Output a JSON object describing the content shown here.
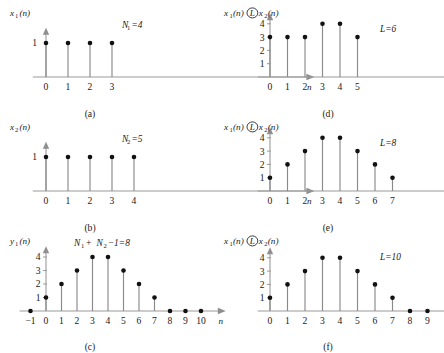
{
  "figure": {
    "caption_prefix": "",
    "axis_label_x": "n"
  },
  "chart_data": [
    {
      "id": "a",
      "type": "stem",
      "title": "",
      "ylabel": "x₁(n)",
      "ylabel_base": "x",
      "ylabel_sub": "1",
      "ylabel_tail": "(n)",
      "xlabel": "n",
      "subcaption": "(a)",
      "annotation": "N₁=4",
      "annotation_base": "N",
      "annotation_sub": "1",
      "annotation_tail": "=4",
      "x": [
        0,
        1,
        2,
        3
      ],
      "values": [
        1,
        1,
        1,
        1
      ],
      "xticks": [
        0,
        1,
        2,
        3
      ],
      "yticks": [
        1
      ],
      "ytick_labels": [
        "1"
      ],
      "ylim": [
        0,
        1.45
      ],
      "xlim": [
        -0.6,
        12.2
      ],
      "grid": false,
      "legend": "none"
    },
    {
      "id": "b",
      "type": "stem",
      "title": "",
      "ylabel": "x₂(n)",
      "ylabel_base": "x",
      "ylabel_sub": "2",
      "ylabel_tail": "(n)",
      "xlabel": "n",
      "subcaption": "(b)",
      "annotation": "N₂=5",
      "annotation_base": "N",
      "annotation_sub": "2",
      "annotation_tail": "=5",
      "x": [
        0,
        1,
        2,
        3,
        4
      ],
      "values": [
        1,
        1,
        1,
        1,
        1
      ],
      "xticks": [
        0,
        1,
        2,
        3,
        4
      ],
      "yticks": [
        1
      ],
      "ytick_labels": [
        "1"
      ],
      "ylim": [
        0,
        1.45
      ],
      "xlim": [
        -0.6,
        12.2
      ],
      "grid": false,
      "legend": "none"
    },
    {
      "id": "c",
      "type": "stem",
      "title": "",
      "ylabel": "y₁(n)",
      "ylabel_base": "y",
      "ylabel_sub": "1",
      "ylabel_tail": "(n)",
      "xlabel": "n",
      "subcaption": "(c)",
      "annotation": "N₁ + N₂ −1=8",
      "annotation_parts": [
        "N",
        "1",
        " + ",
        "N",
        "2",
        " −1=8"
      ],
      "x": [
        -1,
        0,
        1,
        2,
        3,
        4,
        5,
        6,
        7,
        8,
        9,
        10
      ],
      "values": [
        0,
        1,
        2,
        3,
        4,
        4,
        3,
        2,
        1,
        0,
        0,
        0
      ],
      "xticks": [
        -1,
        0,
        1,
        2,
        3,
        4,
        5,
        6,
        7,
        8,
        9,
        10
      ],
      "xtick_labels": [
        "−1",
        "0",
        "1",
        "2",
        "3",
        "4",
        "5",
        "6",
        "7",
        "8",
        "9",
        "10"
      ],
      "yticks": [
        1,
        2,
        3,
        4
      ],
      "ytick_labels": [
        "1",
        "2",
        "3",
        "4"
      ],
      "ylim": [
        0,
        4.8
      ],
      "xlim": [
        -1.7,
        11.6
      ],
      "grid": false,
      "legend": "none"
    },
    {
      "id": "d",
      "type": "stem",
      "title": "",
      "ylabel": "x₁(n) Ⓛ x₂(n)",
      "ylabel_parts": [
        "x",
        "1",
        "(n)",
        "L",
        "x",
        "2",
        "(n)"
      ],
      "xlabel": "n",
      "subcaption": "(d)",
      "annotation": "L=6",
      "annotation_base": "L",
      "annotation_tail": "=6",
      "x": [
        0,
        1,
        2,
        3,
        4,
        5
      ],
      "values": [
        3,
        3,
        3,
        4,
        4,
        3
      ],
      "xticks": [
        0,
        1,
        2,
        3,
        4,
        5
      ],
      "yticks": [
        1,
        2,
        3,
        4
      ],
      "ytick_labels": [
        "1",
        "2",
        "3",
        "4"
      ],
      "ylim": [
        0,
        4.8
      ],
      "xlim": [
        -0.7,
        11.6
      ],
      "grid": false,
      "legend": "none"
    },
    {
      "id": "e",
      "type": "stem",
      "title": "",
      "ylabel": "x₁(n) Ⓛ x₂(n)",
      "ylabel_parts": [
        "x",
        "1",
        "(n)",
        "L",
        "x",
        "2",
        "(n)"
      ],
      "xlabel": "n",
      "subcaption": "(e)",
      "annotation": "L=8",
      "annotation_base": "L",
      "annotation_tail": "=8",
      "x": [
        0,
        1,
        2,
        3,
        4,
        5,
        6,
        7
      ],
      "values": [
        1,
        2,
        3,
        4,
        4,
        3,
        2,
        1
      ],
      "xticks": [
        0,
        1,
        2,
        3,
        4,
        5,
        6,
        7
      ],
      "yticks": [
        1,
        2,
        3,
        4
      ],
      "ytick_labels": [
        "1",
        "2",
        "3",
        "4"
      ],
      "ylim": [
        0,
        4.8
      ],
      "xlim": [
        -0.7,
        11.6
      ],
      "grid": false,
      "legend": "none"
    },
    {
      "id": "f",
      "type": "stem",
      "title": "",
      "ylabel": "x₁(n) Ⓛ x₂(n)",
      "ylabel_parts": [
        "x",
        "1",
        "(n)",
        "L",
        "x",
        "2",
        "(n)"
      ],
      "xlabel": "n",
      "subcaption": "(f)",
      "annotation": "L=10",
      "annotation_base": "L",
      "annotation_tail": "=10",
      "x": [
        0,
        1,
        2,
        3,
        4,
        5,
        6,
        7,
        8,
        9
      ],
      "values": [
        1,
        2,
        3,
        4,
        4,
        3,
        2,
        1,
        0,
        0
      ],
      "xticks": [
        0,
        1,
        2,
        3,
        4,
        5,
        6,
        7,
        8,
        9
      ],
      "yticks": [
        1,
        2,
        3,
        4
      ],
      "ytick_labels": [
        "1",
        "2",
        "3",
        "4"
      ],
      "ylim": [
        0,
        4.8
      ],
      "xlim": [
        -0.7,
        11.6
      ],
      "grid": false,
      "legend": "none"
    }
  ],
  "panels": {
    "a": {
      "subcaption": "(a)",
      "annotation": "N₁=4",
      "ylabel": "x₁(n)",
      "xlabel": "n"
    },
    "b": {
      "subcaption": "(b)",
      "annotation": "N₂=5",
      "ylabel": "x₂(n)",
      "xlabel": "n"
    },
    "c": {
      "subcaption": "(c)",
      "annotation": "N₁ + N₂ −1=8",
      "ylabel": "y₁(n)",
      "xlabel": "n"
    },
    "d": {
      "subcaption": "(d)",
      "annotation": "L=6",
      "ylabel": "x₁(n) Ⓛ x₂(n)",
      "xlabel": "n"
    },
    "e": {
      "subcaption": "(e)",
      "annotation": "L=8",
      "ylabel": "x₁(n) Ⓛ x₂(n)",
      "xlabel": "n"
    },
    "f": {
      "subcaption": "(f)",
      "annotation": "L=10",
      "ylabel": "x₁(n) Ⓛ x₂(n)",
      "xlabel": "n"
    }
  },
  "colors": {
    "axis": "#9a9a9a",
    "stem": "#8a8a8a",
    "marker": "#111111",
    "text": "#1a1a1a",
    "background": "#ffffff"
  }
}
